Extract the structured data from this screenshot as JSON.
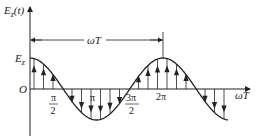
{
  "diagram": {
    "title": "",
    "y_axis_label": {
      "main": "E",
      "subscript": "z",
      "arg": "(t)"
    },
    "x_axis_label": "ωT",
    "origin_label": "O",
    "amplitude_label": {
      "main": "E",
      "subscript": "z"
    },
    "period_dimension_label": "ωT",
    "tick_labels": [
      {
        "id": "pi-half",
        "num": "π",
        "den": "2"
      },
      {
        "id": "pi",
        "text": "π"
      },
      {
        "id": "three-pi-half",
        "num": "3π",
        "den": "2"
      },
      {
        "id": "two-pi",
        "text": "2π"
      }
    ],
    "curve": "cosine",
    "arrow_direction_note": "field vectors along curve, up above axis, down below axis",
    "colors": {
      "stroke": "#222222",
      "background": "#ffffff"
    }
  }
}
